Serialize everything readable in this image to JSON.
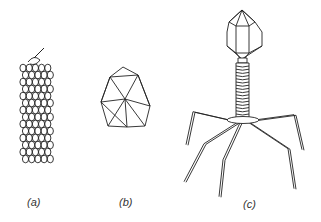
{
  "figure": {
    "panels": [
      {
        "id": "a",
        "label": "(a)",
        "description": "helical virus"
      },
      {
        "id": "b",
        "label": "(b)",
        "description": "icosahedral virus"
      },
      {
        "id": "c",
        "label": "(c)",
        "description": "bacteriophage"
      }
    ],
    "colors": {
      "stroke": "#222222",
      "background": "#ffffff",
      "label": "#333333"
    }
  }
}
